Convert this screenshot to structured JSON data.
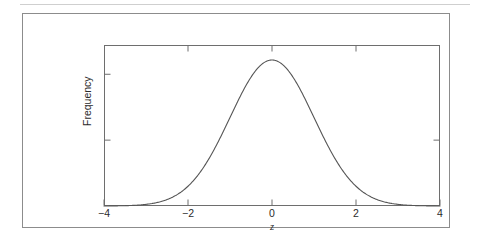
{
  "figure": {
    "background_color": "#ffffff",
    "frame_color": "#8c8c8c",
    "axis_color": "#6e6e6e",
    "curve_color": "#555555",
    "text_color": "#2b2b2b",
    "top_rule_color": "#cfcfcf"
  },
  "chart_data": {
    "type": "line",
    "title": "",
    "subtitle": "",
    "xlabel": "z",
    "ylabel": "Frequency",
    "xlim": [
      -4,
      4
    ],
    "ylim": [
      0,
      0.44
    ],
    "grid": false,
    "legend": null,
    "legend_position": "none",
    "xticks": [
      -4,
      -2,
      0,
      2,
      4
    ],
    "xtick_labels": [
      "−4",
      "−2",
      "0",
      "2",
      "4"
    ],
    "yticks": [
      0.18,
      0.36
    ],
    "ytick_labels": [
      "",
      ""
    ],
    "top_axis_ticks": [
      -2,
      0,
      2
    ],
    "right_axis_ticks": [
      0.18
    ],
    "tick_direction": "in",
    "annotations": [],
    "series": [
      {
        "name": "standard normal density",
        "distribution": "normal",
        "mean": 0,
        "sd": 1,
        "peak_value": 0.3989,
        "x": [
          -4,
          -3.8,
          -3.6,
          -3.4,
          -3.2,
          -3,
          -2.8,
          -2.6,
          -2.4,
          -2.2,
          -2,
          -1.8,
          -1.6,
          -1.4,
          -1.2,
          -1,
          -0.8,
          -0.6,
          -0.4,
          -0.2,
          0,
          0.2,
          0.4,
          0.6,
          0.8,
          1,
          1.2,
          1.4,
          1.6,
          1.8,
          2,
          2.2,
          2.4,
          2.6,
          2.8,
          3,
          3.2,
          3.4,
          3.6,
          3.8,
          4
        ],
        "values": [
          0.0001,
          0.0003,
          0.0006,
          0.0012,
          0.0024,
          0.0044,
          0.0079,
          0.0136,
          0.0224,
          0.0355,
          0.054,
          0.079,
          0.1109,
          0.1497,
          0.1942,
          0.242,
          0.2897,
          0.3332,
          0.3683,
          0.391,
          0.3989,
          0.391,
          0.3683,
          0.3332,
          0.2897,
          0.242,
          0.1942,
          0.1497,
          0.1109,
          0.079,
          0.054,
          0.0355,
          0.0224,
          0.0136,
          0.0079,
          0.0044,
          0.0024,
          0.0012,
          0.0006,
          0.0003,
          0.0001
        ]
      }
    ]
  }
}
